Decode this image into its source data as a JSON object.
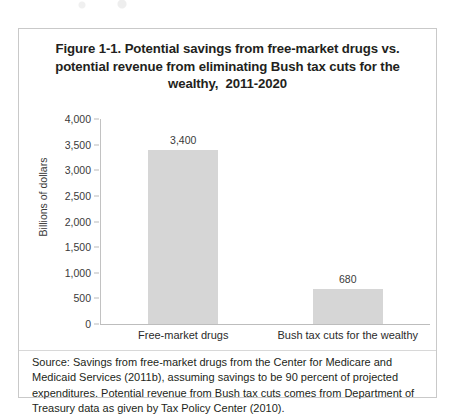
{
  "figure": {
    "title": "Figure 1-1. Potential savings from free-market drugs vs. potential revenue from eliminating Bush tax cuts for the wealthy,  2011-2020",
    "source_note": "Source:  Savings from free-market drugs from the Center for Medicare and Medicaid Services (2011b), assuming savings to be 90 percent of projected expenditures. Potential revenue from Bush tax cuts comes from Department of Treasury data as given by Tax Policy Center (2010)."
  },
  "chart_data": {
    "type": "bar",
    "title": "Figure 1-1. Potential savings from free-market drugs vs. potential revenue from eliminating Bush tax cuts for the wealthy,  2011-2020",
    "categories": [
      "Free-market drugs",
      "Bush tax cuts for the wealthy"
    ],
    "values": [
      3400,
      680
    ],
    "data_labels": [
      "3,400",
      "680"
    ],
    "xlabel": "",
    "ylabel": "Billions of dollars",
    "ylim": [
      0,
      4000
    ],
    "ytick_step": 500,
    "ytick_labels": [
      "4,000",
      "3,500",
      "3,000",
      "2,500",
      "2,000",
      "1,500",
      "1,000",
      "500",
      "0"
    ],
    "ytick_values": [
      4000,
      3500,
      3000,
      2500,
      2000,
      1500,
      1000,
      500,
      0
    ],
    "grid": false,
    "legend": false,
    "bar_color": "#d6d6d6",
    "axis_color": "#c2c2c2"
  }
}
